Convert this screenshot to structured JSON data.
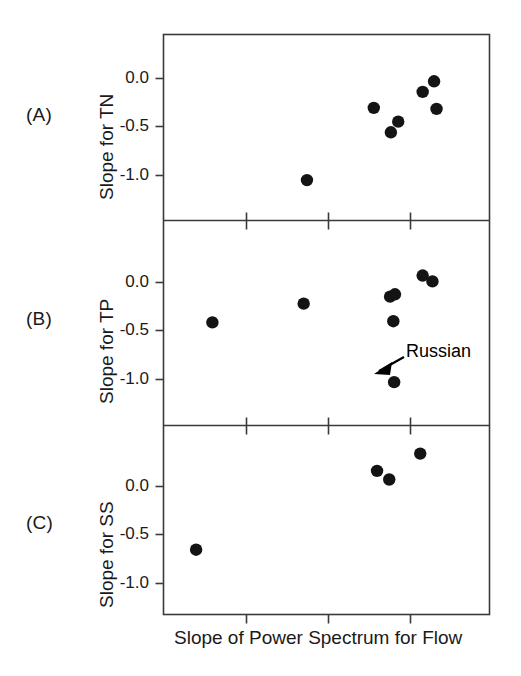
{
  "figure": {
    "xlabel": "Slope of Power Spectrum for Flow",
    "panel_a_letter": "(A)",
    "panel_b_letter": "(B)",
    "panel_c_letter": "(C)",
    "annotation_label": "Russian",
    "marker_color": "#141414",
    "axis_color": "#3a3a3a",
    "background": "#ffffff"
  },
  "yticklabels": {
    "t0": "0.0",
    "t1": "-0.5",
    "t2": "-1.0"
  },
  "chart_data": [
    {
      "type": "scatter",
      "panel": "(A)",
      "title": "",
      "xlabel": "Slope of Power Spectrum for Flow",
      "ylabel": "Slope for TN",
      "ylim": [
        -1.35,
        0.4
      ],
      "xlim": [
        0.0,
        4.0
      ],
      "yticks": [
        0.0,
        -0.5,
        -1.0
      ],
      "yticklabels": [
        "0.0",
        "-0.5",
        "-1.0"
      ],
      "xticks": [
        1.0,
        2.0,
        3.0
      ],
      "xticklabels": [
        "",
        "",
        ""
      ],
      "grid": false,
      "legend": "none",
      "points": [
        {
          "x": 1.76,
          "y": -0.97
        },
        {
          "x": 2.58,
          "y": -0.29
        },
        {
          "x": 2.79,
          "y": -0.52
        },
        {
          "x": 2.88,
          "y": -0.42
        },
        {
          "x": 3.18,
          "y": -0.14
        },
        {
          "x": 3.32,
          "y": -0.04
        },
        {
          "x": 3.35,
          "y": -0.3
        }
      ]
    },
    {
      "type": "scatter",
      "panel": "(B)",
      "title": "",
      "xlabel": "Slope of Power Spectrum for Flow",
      "ylabel": "Slope for TP",
      "ylim": [
        -1.35,
        0.4
      ],
      "xlim": [
        0.0,
        4.0
      ],
      "yticks": [
        0.0,
        -0.5,
        -1.0
      ],
      "yticklabels": [
        "0.0",
        "-0.5",
        "-1.0"
      ],
      "xticks": [
        1.0,
        2.0,
        3.0
      ],
      "xticklabels": [
        "",
        "",
        ""
      ],
      "grid": false,
      "legend": "none",
      "annotations": [
        {
          "text": "Russian",
          "point_x": 2.83,
          "point_y": -0.98
        }
      ],
      "points": [
        {
          "x": 0.6,
          "y": -0.47
        },
        {
          "x": 1.72,
          "y": -0.31
        },
        {
          "x": 2.78,
          "y": -0.25
        },
        {
          "x": 2.84,
          "y": -0.23
        },
        {
          "x": 2.82,
          "y": -0.46
        },
        {
          "x": 3.18,
          "y": -0.07
        },
        {
          "x": 3.3,
          "y": -0.12
        },
        {
          "x": 2.83,
          "y": -0.98
        }
      ]
    },
    {
      "type": "scatter",
      "panel": "(C)",
      "title": "",
      "xlabel": "Slope of Power Spectrum for Flow",
      "ylabel": "Slope for SS",
      "ylim": [
        -1.35,
        0.4
      ],
      "xlim": [
        0.0,
        4.0
      ],
      "yticks": [
        0.0,
        -0.5,
        -1.0
      ],
      "yticklabels": [
        "0.0",
        "-0.5",
        "-1.0"
      ],
      "xticks": [
        1.0,
        2.0,
        3.0
      ],
      "xticklabels": [
        "",
        "",
        ""
      ],
      "grid": false,
      "legend": "none",
      "points": [
        {
          "x": 0.4,
          "y": -0.75
        },
        {
          "x": 2.62,
          "y": -0.02
        },
        {
          "x": 2.77,
          "y": -0.1
        },
        {
          "x": 3.15,
          "y": 0.14
        }
      ]
    }
  ]
}
